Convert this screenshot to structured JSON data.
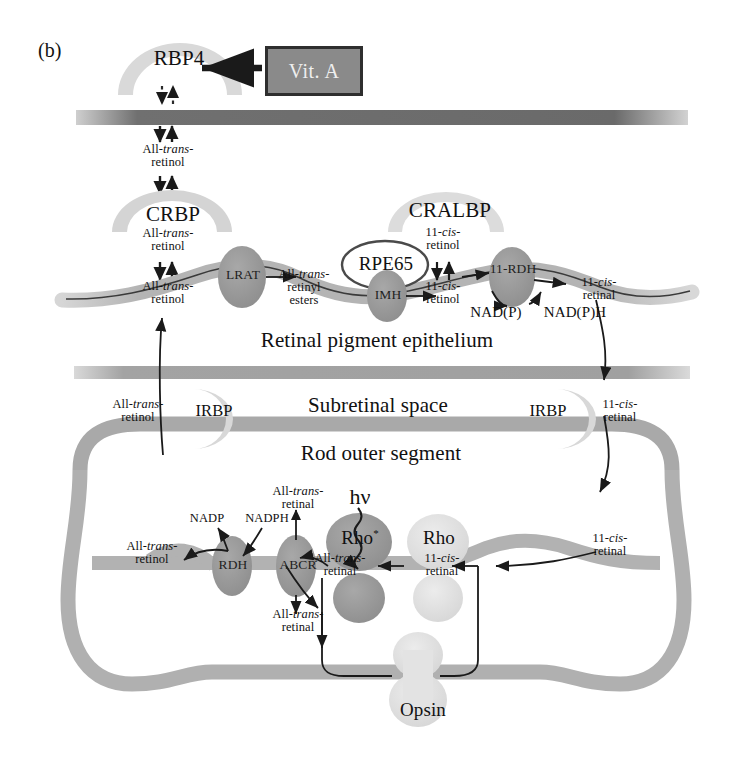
{
  "figure": {
    "panel_label": "(b)",
    "type": "visual-cycle-diagram"
  },
  "compartments": {
    "rpe": "Retinal pigment epithelium",
    "subretinal": "Subretinal space",
    "ros": "Rod outer segment"
  },
  "source_box": {
    "label": "Vit. A"
  },
  "carrier_proteins": {
    "rbp4": "RBP4",
    "crbp": "CRBP",
    "cralbp": "CRALBP",
    "irbp_left": "IRBP",
    "irbp_right": "IRBP"
  },
  "enzymes": {
    "lrat": "LRAT",
    "rpe65": "RPE65",
    "imh": "IMH",
    "rdh11": "11-RDH",
    "rdh": "RDH",
    "abcr": "ABCR"
  },
  "pigments": {
    "rho_active": "Rho",
    "rho_active_mark": "*",
    "rho": "Rho",
    "opsin": "Opsin"
  },
  "photon": {
    "label": "hν"
  },
  "cofactors": {
    "nadp_ox": "NAD(P)",
    "nadp_red": "NAD(P)H",
    "nadp": "NADP",
    "nadph": "NADPH"
  },
  "metabolites": {
    "atr_ol_1": {
      "line1": "All-",
      "ital": "trans",
      "dash": "-",
      "line2": "retinol"
    },
    "atr_al_1": {
      "line1": "All-",
      "ital": "trans",
      "dash": "-",
      "line2": "retinal"
    },
    "atr_esters": {
      "line1": "All-",
      "ital": "trans",
      "dash": "-",
      "line2": "retinyl",
      "line3": "esters"
    },
    "cis_ol": {
      "line1": "11-",
      "ital": "cis",
      "dash": "-",
      "line2": "retinol"
    },
    "cis_al": {
      "line1": "11-",
      "ital": "cis",
      "dash": "-",
      "line2": "retinal"
    }
  },
  "label_instances": [
    {
      "id": "atr-ol-blood",
      "text": "All-trans-retinol"
    },
    {
      "id": "atr-ol-crbp-up",
      "text": "All-trans-retinol"
    },
    {
      "id": "atr-ol-crbp-dn",
      "text": "All-trans-retinol"
    },
    {
      "id": "atr-esters",
      "text": "All-trans-retinyl esters"
    },
    {
      "id": "cis-ol-cralbp-up",
      "text": "11-cis-retinol"
    },
    {
      "id": "cis-ol-cralbp-dn",
      "text": "11-cis-retinol"
    },
    {
      "id": "cis-al-rpe",
      "text": "11-cis-retinal"
    },
    {
      "id": "atr-ol-irbp",
      "text": "All-trans-retinol"
    },
    {
      "id": "cis-al-irbp",
      "text": "11-cis-retinal"
    },
    {
      "id": "atr-ol-ros",
      "text": "All-trans-retinol"
    },
    {
      "id": "atr-al-abcr-up",
      "text": "All-trans-retinal"
    },
    {
      "id": "atr-al-abcr-dn",
      "text": "All-trans-retinal"
    },
    {
      "id": "atr-al-rho",
      "text": "All-trans-retinal"
    },
    {
      "id": "cis-al-rho",
      "text": "11-cis-retinal"
    },
    {
      "id": "cis-al-ros",
      "text": "11-cis-retinal"
    }
  ],
  "colors": {
    "membrane_dark": "#6b6b6b",
    "membrane_light": "#b8b8b8",
    "protein_dark": "#9a9a9a",
    "protein_light": "#d8d8d8",
    "blob_pale": "#e0e0e0",
    "ink": "#1a1a1a",
    "box_fill": "#8a8a8a",
    "box_border": "#2e2e2e"
  }
}
